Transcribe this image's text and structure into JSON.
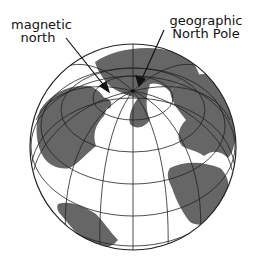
{
  "diagram": {
    "labels": {
      "magnetic": "magnetic\nnorth",
      "geographic": "geographic\nNorth Pole"
    },
    "colors": {
      "land": "#666666",
      "ocean": "#ffffff",
      "gridlines": "#222222",
      "text": "#111111"
    },
    "globe": {
      "center": [
        133,
        147
      ],
      "radius": 103,
      "north_pole": [
        133,
        91
      ],
      "magnetic_pole_arrow_tip": [
        109,
        90
      ]
    }
  }
}
